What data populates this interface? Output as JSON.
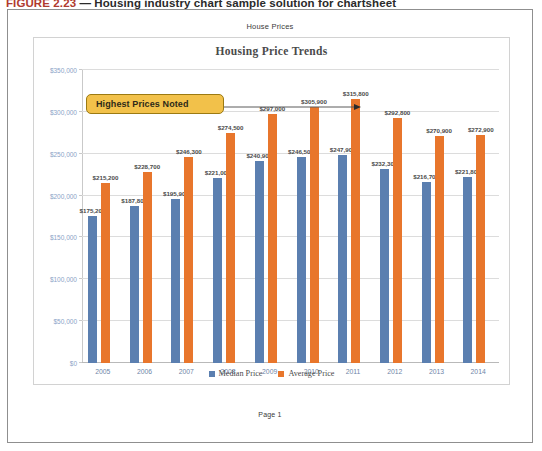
{
  "figure_caption": {
    "number": "FIGURE 2.23",
    "dash": "—",
    "text": "Housing industry chart sample solution for chartsheet"
  },
  "sheet": {
    "header": "House Prices",
    "footer": "Page 1"
  },
  "callout": {
    "label": "Highest Prices Noted"
  },
  "colors": {
    "median": "#5B7FB0",
    "average": "#E8762C",
    "callout_fill": "#F2C14A",
    "callout_border": "#9C7A12",
    "axis_text": "#8BA3C7",
    "title_text": "#4A4A4A"
  },
  "chart_data": {
    "type": "bar",
    "title": "Housing Price Trends",
    "xlabel": "",
    "ylabel": "",
    "ylim": [
      0,
      350000
    ],
    "ytick_step": 50000,
    "ytick_labels": [
      "$350,000",
      "$300,000",
      "$250,000",
      "$200,000",
      "$150,000",
      "$100,000",
      "$50,000",
      "$0"
    ],
    "ytick_values": [
      350000,
      300000,
      250000,
      200000,
      150000,
      100000,
      50000,
      0
    ],
    "grid": true,
    "legend_position": "bottom",
    "categories": [
      "2005",
      "2006",
      "2007",
      "2008",
      "2009",
      "2010",
      "2011",
      "2012",
      "2013",
      "2014"
    ],
    "series": [
      {
        "name": "Median Price",
        "color": "#5B7FB0",
        "values": [
          175200,
          187800,
          195900,
          221000,
          240900,
          246500,
          247900,
          232300,
          216700,
          221800
        ],
        "labels": [
          "$175,200",
          "$187,800",
          "$195,900",
          "$221,000",
          "$240,900",
          "$246,500",
          "$247,900",
          "$232,300",
          "$216,700",
          "$221,800"
        ]
      },
      {
        "name": "Average Price",
        "color": "#E8762C",
        "values": [
          215200,
          228700,
          246300,
          274500,
          297000,
          305900,
          315800,
          292800,
          270900,
          272900
        ],
        "labels": [
          "$215,200",
          "$228,700",
          "$246,300",
          "$274,500",
          "$297,000",
          "$305,900",
          "$315,800",
          "$292,800",
          "$270,900",
          "$272,900"
        ]
      }
    ],
    "annotations": [
      {
        "text": "Highest Prices Noted",
        "points_to_category": "2011",
        "points_to_series": "Average Price"
      }
    ]
  }
}
